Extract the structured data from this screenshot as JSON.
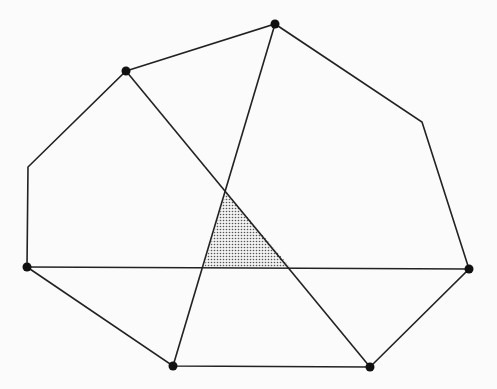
{
  "diagram": {
    "width": 497,
    "height": 389,
    "background": "#fbfbfb",
    "stroke_color": "#222222",
    "fill_pattern": "stipple",
    "polygon_outline": [
      [
        126,
        71
      ],
      [
        275,
        24
      ],
      [
        422,
        122
      ],
      [
        469,
        269
      ],
      [
        370,
        367
      ],
      [
        173,
        366
      ],
      [
        27,
        267
      ],
      [
        28,
        167
      ]
    ],
    "vertices_marked": [
      {
        "id": "v1",
        "x": 126,
        "y": 71
      },
      {
        "id": "v2",
        "x": 275,
        "y": 24
      },
      {
        "id": "v3",
        "x": 469,
        "y": 269
      },
      {
        "id": "v4",
        "x": 370,
        "y": 367
      },
      {
        "id": "v5",
        "x": 173,
        "y": 366
      },
      {
        "id": "v6",
        "x": 27,
        "y": 267
      }
    ],
    "diagonals": [
      {
        "id": "d1",
        "from": "v6",
        "to": "v3"
      },
      {
        "id": "d2",
        "from": "v1",
        "to": "v4"
      },
      {
        "id": "d3",
        "from": "v2",
        "to": "v5"
      }
    ],
    "shaded_triangle": [
      [
        226,
        192
      ],
      [
        204,
        267
      ],
      [
        290,
        267
      ]
    ]
  }
}
